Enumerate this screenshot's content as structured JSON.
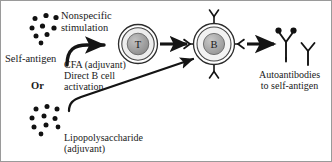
{
  "figure": {
    "type": "biological-pathway-diagram",
    "background_color": "#ffffff",
    "border_color": "#9a9a9a",
    "ink_color": "#1a1a1a"
  },
  "labels": {
    "self_antigen": "Self-antigen",
    "nonspecific_stimulation": "Nonspecific\nstimulation",
    "cfa_direct": "CFA (adjuvant)\nDirect B cell\nactivation",
    "or": "Or",
    "lipopolysaccharide": "Lipopolysaccharide\n(adjuvant)",
    "autoantibodies": "Autoantibodies\nto self-antigen"
  },
  "cells": {
    "t_cell": {
      "label": "T",
      "membrane_color": "#e8e8e8",
      "nucleus_color": "#9b9b9b"
    },
    "b_cell": {
      "label": "B",
      "membrane_color": "#f0f0f0",
      "nucleus_color": "#a3a3a3",
      "receptor_count": 4
    }
  },
  "antigen_clusters": {
    "top": {
      "name": "self-antigen-dots-top",
      "dot_count": 9,
      "dot_color": "#111111"
    },
    "bottom": {
      "name": "self-antigen-dots-bottom",
      "dot_count": 10,
      "dot_color": "#111111"
    }
  },
  "antibodies": {
    "count": 3,
    "bound_antigen_dots": 2,
    "color": "#111111"
  },
  "arrows": {
    "stimulation_to_t": "curved-hook-arrow",
    "t_to_b": "straight-arrow",
    "lps_to_b": "long-diagonal-hook-arrow",
    "b_to_antibodies": "straight-arrow"
  }
}
